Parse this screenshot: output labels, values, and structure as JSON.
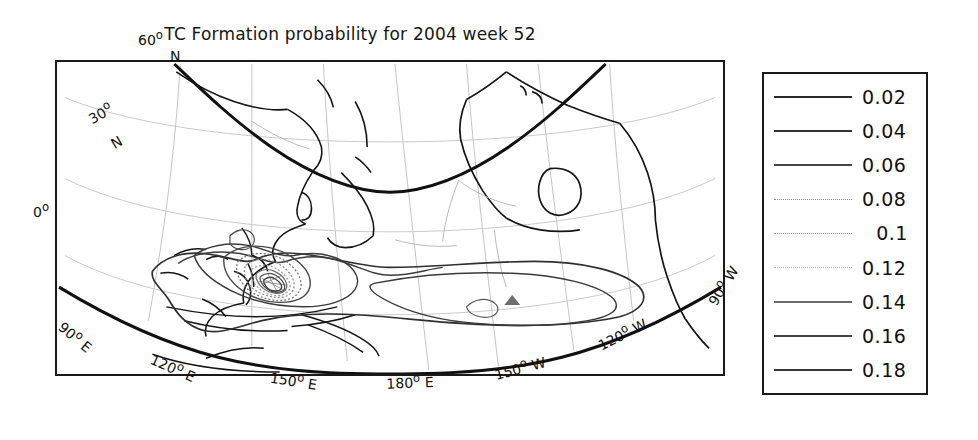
{
  "chart_data": {
    "type": "contour-map",
    "title": "TC Formation probability for 2004 week 52",
    "projection": "curved conic / lambert-style world map",
    "region": "Western & Central Pacific, East Asia to North America",
    "variable": "Tropical Cyclone formation probability",
    "contour_levels": [
      0.02,
      0.04,
      0.06,
      0.08,
      0.1,
      0.12,
      0.14,
      0.16,
      0.18
    ],
    "legend_position": "right outside panel",
    "grid": true,
    "latitude_ticks": [
      "60° N",
      "30° N",
      "0°"
    ],
    "longitude_ticks": [
      "90° E",
      "120° E",
      "150° E",
      "180° E",
      "150° W",
      "120° W",
      "90° W"
    ],
    "maximum_probability_location": "near 130°E, 8°N (Philippine Sea / W. Pacific warm pool)",
    "peak_contour_reached": 0.18,
    "colors": {
      "frame": "#1a1a1a",
      "coastline": "#111111",
      "graticule": "#bdbdbd",
      "contour": "#333333",
      "background": "#ffffff"
    }
  },
  "title": {
    "text": "TC Formation probability for 2004 week 52"
  },
  "map": {
    "latitude_labels": [
      {
        "text": "60°",
        "sub": "N",
        "x": 138,
        "y": 30,
        "rot": 0
      },
      {
        "text": "30°",
        "sub": "N",
        "x": 82,
        "y": 112,
        "rot": -28
      },
      {
        "text": "0°",
        "sub": "",
        "x": 33,
        "y": 205,
        "rot": 0
      }
    ],
    "longitude_labels": [
      {
        "text": "90° E",
        "x": 66,
        "y": 318,
        "rot": 38
      },
      {
        "text": "120° E",
        "x": 152,
        "y": 350,
        "rot": 24
      },
      {
        "text": "150° E",
        "x": 268,
        "y": 366,
        "rot": 9
      },
      {
        "text": "180° E",
        "x": 382,
        "y": 372,
        "rot": -2
      },
      {
        "text": "150° W",
        "x": 488,
        "y": 366,
        "rot": -14
      },
      {
        "text": "120° W",
        "x": 592,
        "y": 342,
        "rot": -26
      },
      {
        "text": "90° W",
        "x": 700,
        "y": 300,
        "rot": -56
      }
    ]
  },
  "legend": {
    "entries": [
      {
        "label": "0.02",
        "color": "#2b2b2b",
        "weight": 2.0,
        "dash": "none"
      },
      {
        "label": "0.04",
        "color": "#333333",
        "weight": 1.8,
        "dash": "none"
      },
      {
        "label": "0.06",
        "color": "#444444",
        "weight": 1.6,
        "dash": "none"
      },
      {
        "label": "0.08",
        "color": "#8e8e8e",
        "weight": 1.4,
        "dash": "dotted"
      },
      {
        "label": "0.1",
        "color": "#9a9a9a",
        "weight": 1.4,
        "dash": "dotted"
      },
      {
        "label": "0.12",
        "color": "#b5b5b5",
        "weight": 1.5,
        "dash": "dotted"
      },
      {
        "label": "0.14",
        "color": "#6b6b6b",
        "weight": 1.6,
        "dash": "none"
      },
      {
        "label": "0.16",
        "color": "#454545",
        "weight": 1.7,
        "dash": "none"
      },
      {
        "label": "0.18",
        "color": "#3a3a3a",
        "weight": 1.8,
        "dash": "none"
      }
    ]
  }
}
